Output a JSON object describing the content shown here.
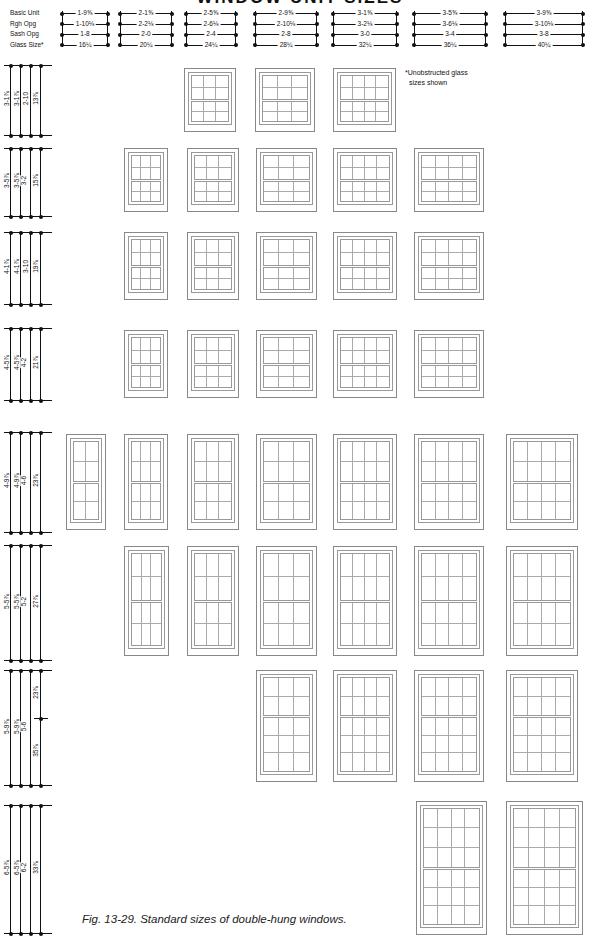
{
  "title": "WINDOW UNIT SIZES",
  "legend": [
    "Basic Unit",
    "Rgh Opg",
    "Sash Opg",
    "Glass Size*"
  ],
  "note": [
    "*Unobstructed glass",
    "sizes shown"
  ],
  "caption": "Fig. 13-29. Standard sizes of double-hung windows.",
  "columns": [
    {
      "x": 62,
      "w": 46,
      "values": [
        "1-9⅝",
        "1-10⅛",
        "1-8",
        "16¼"
      ]
    },
    {
      "x": 120,
      "w": 52,
      "values": [
        "2-1⅝",
        "2-2⅛",
        "2-0",
        "20¼"
      ]
    },
    {
      "x": 186,
      "w": 50,
      "values": [
        "2-5⅝",
        "2-6⅛",
        "2-4",
        "24¼"
      ]
    },
    {
      "x": 255,
      "w": 62,
      "values": [
        "2-9⅝",
        "2-10⅛",
        "2-8",
        "28¼"
      ]
    },
    {
      "x": 333,
      "w": 64,
      "values": [
        "3-1⅝",
        "3-2⅛",
        "3-0",
        "32¼"
      ]
    },
    {
      "x": 414,
      "w": 72,
      "values": [
        "3-5⅝",
        "3-6⅛",
        "3-4",
        "36¼"
      ]
    },
    {
      "x": 505,
      "w": 78,
      "values": [
        "3-9⅝",
        "3-10⅛",
        "3-8",
        "40¼"
      ]
    }
  ],
  "rows": [
    {
      "y": 65,
      "h": 70,
      "values": [
        "3-1⅞",
        "3-1⅞",
        "2-10",
        "13⅞"
      ]
    },
    {
      "y": 148,
      "h": 68,
      "values": [
        "3-5⅞",
        "3-5⅞",
        "3-2",
        "15⅞"
      ]
    },
    {
      "y": 232,
      "h": 72,
      "values": [
        "4-1⅞",
        "4-1⅞",
        "3-10",
        "19⅞"
      ]
    },
    {
      "y": 328,
      "h": 72,
      "values": [
        "4-5⅞",
        "4-5⅞",
        "4-2",
        "21⅞"
      ]
    },
    {
      "y": 432,
      "h": 100,
      "values": [
        "4-9⅞",
        "4-9⅞",
        "4-6",
        "23⅞"
      ]
    },
    {
      "y": 545,
      "h": 115,
      "values": [
        "5-5⅞",
        "5-5⅞",
        "5-2",
        "27⅞"
      ]
    },
    {
      "y": 670,
      "h": 115,
      "values": [
        "5-9⅞",
        "5-9⅞",
        "5-6",
        "23⅞",
        "35⅞"
      ]
    },
    {
      "y": 805,
      "h": 128,
      "values": [
        "6-5⅞",
        "6-5⅞",
        "6-2",
        "33⅞"
      ]
    }
  ],
  "windows": [
    {
      "row": 0,
      "col": 2,
      "x": 184,
      "y": 68,
      "w": 52,
      "h": 64,
      "cols": 3,
      "top": 2,
      "bot": 2
    },
    {
      "row": 0,
      "col": 3,
      "x": 255,
      "y": 68,
      "w": 60,
      "h": 64,
      "cols": 3,
      "top": 2,
      "bot": 2
    },
    {
      "row": 0,
      "col": 4,
      "x": 333,
      "y": 68,
      "w": 63,
      "h": 64,
      "cols": 4,
      "top": 2,
      "bot": 2
    },
    {
      "row": 1,
      "col": 1,
      "x": 124,
      "y": 148,
      "w": 44,
      "h": 64,
      "cols": 3,
      "top": 2,
      "bot": 2
    },
    {
      "row": 1,
      "col": 2,
      "x": 187,
      "y": 148,
      "w": 52,
      "h": 64,
      "cols": 3,
      "top": 2,
      "bot": 2
    },
    {
      "row": 1,
      "col": 3,
      "x": 256,
      "y": 148,
      "w": 61,
      "h": 64,
      "cols": 3,
      "top": 2,
      "bot": 2
    },
    {
      "row": 1,
      "col": 4,
      "x": 333,
      "y": 148,
      "w": 64,
      "h": 64,
      "cols": 4,
      "top": 2,
      "bot": 2
    },
    {
      "row": 1,
      "col": 5,
      "x": 414,
      "y": 148,
      "w": 70,
      "h": 64,
      "cols": 4,
      "top": 2,
      "bot": 2
    },
    {
      "row": 2,
      "col": 1,
      "x": 124,
      "y": 232,
      "w": 44,
      "h": 68,
      "cols": 3,
      "top": 2,
      "bot": 2
    },
    {
      "row": 2,
      "col": 2,
      "x": 187,
      "y": 232,
      "w": 52,
      "h": 68,
      "cols": 3,
      "top": 2,
      "bot": 2
    },
    {
      "row": 2,
      "col": 3,
      "x": 256,
      "y": 232,
      "w": 61,
      "h": 68,
      "cols": 3,
      "top": 2,
      "bot": 2
    },
    {
      "row": 2,
      "col": 4,
      "x": 333,
      "y": 232,
      "w": 64,
      "h": 68,
      "cols": 4,
      "top": 2,
      "bot": 2
    },
    {
      "row": 2,
      "col": 5,
      "x": 414,
      "y": 232,
      "w": 70,
      "h": 68,
      "cols": 4,
      "top": 2,
      "bot": 2
    },
    {
      "row": 3,
      "col": 1,
      "x": 124,
      "y": 330,
      "w": 44,
      "h": 68,
      "cols": 3,
      "top": 2,
      "bot": 2
    },
    {
      "row": 3,
      "col": 2,
      "x": 187,
      "y": 330,
      "w": 52,
      "h": 68,
      "cols": 3,
      "top": 2,
      "bot": 2
    },
    {
      "row": 3,
      "col": 3,
      "x": 256,
      "y": 330,
      "w": 61,
      "h": 68,
      "cols": 3,
      "top": 2,
      "bot": 2
    },
    {
      "row": 3,
      "col": 4,
      "x": 333,
      "y": 330,
      "w": 64,
      "h": 68,
      "cols": 4,
      "top": 2,
      "bot": 2
    },
    {
      "row": 3,
      "col": 5,
      "x": 414,
      "y": 330,
      "w": 70,
      "h": 68,
      "cols": 4,
      "top": 2,
      "bot": 2
    },
    {
      "row": 4,
      "col": 0,
      "x": 66,
      "y": 434,
      "w": 40,
      "h": 96,
      "cols": 2,
      "top": 2,
      "bot": 2
    },
    {
      "row": 4,
      "col": 1,
      "x": 124,
      "y": 434,
      "w": 44,
      "h": 96,
      "cols": 3,
      "top": 2,
      "bot": 2
    },
    {
      "row": 4,
      "col": 2,
      "x": 187,
      "y": 434,
      "w": 52,
      "h": 96,
      "cols": 3,
      "top": 2,
      "bot": 2
    },
    {
      "row": 4,
      "col": 3,
      "x": 256,
      "y": 434,
      "w": 61,
      "h": 96,
      "cols": 3,
      "top": 2,
      "bot": 2
    },
    {
      "row": 4,
      "col": 4,
      "x": 333,
      "y": 434,
      "w": 64,
      "h": 96,
      "cols": 4,
      "top": 2,
      "bot": 2
    },
    {
      "row": 4,
      "col": 5,
      "x": 414,
      "y": 434,
      "w": 70,
      "h": 96,
      "cols": 4,
      "top": 2,
      "bot": 2
    },
    {
      "row": 4,
      "col": 6,
      "x": 506,
      "y": 434,
      "w": 72,
      "h": 96,
      "cols": 4,
      "top": 2,
      "bot": 2
    },
    {
      "row": 5,
      "col": 1,
      "x": 124,
      "y": 546,
      "w": 45,
      "h": 110,
      "cols": 3,
      "top": 2,
      "bot": 2
    },
    {
      "row": 5,
      "col": 2,
      "x": 187,
      "y": 546,
      "w": 52,
      "h": 110,
      "cols": 3,
      "top": 2,
      "bot": 2
    },
    {
      "row": 5,
      "col": 3,
      "x": 256,
      "y": 546,
      "w": 61,
      "h": 110,
      "cols": 3,
      "top": 2,
      "bot": 2
    },
    {
      "row": 5,
      "col": 4,
      "x": 333,
      "y": 546,
      "w": 64,
      "h": 110,
      "cols": 4,
      "top": 2,
      "bot": 2
    },
    {
      "row": 5,
      "col": 5,
      "x": 414,
      "y": 546,
      "w": 70,
      "h": 110,
      "cols": 4,
      "top": 2,
      "bot": 2
    },
    {
      "row": 5,
      "col": 6,
      "x": 506,
      "y": 546,
      "w": 72,
      "h": 110,
      "cols": 4,
      "top": 2,
      "bot": 2
    },
    {
      "row": 6,
      "col": 3,
      "x": 256,
      "y": 670,
      "w": 61,
      "h": 112,
      "cols": 3,
      "top": 2,
      "bot": 3
    },
    {
      "row": 6,
      "col": 4,
      "x": 333,
      "y": 670,
      "w": 64,
      "h": 112,
      "cols": 4,
      "top": 2,
      "bot": 3
    },
    {
      "row": 6,
      "col": 5,
      "x": 414,
      "y": 670,
      "w": 70,
      "h": 112,
      "cols": 4,
      "top": 2,
      "bot": 3
    },
    {
      "row": 6,
      "col": 6,
      "x": 506,
      "y": 670,
      "w": 72,
      "h": 112,
      "cols": 4,
      "top": 2,
      "bot": 3
    },
    {
      "row": 7,
      "col": 5,
      "x": 416,
      "y": 801,
      "w": 71,
      "h": 134,
      "cols": 4,
      "top": 3,
      "bot": 3
    },
    {
      "row": 7,
      "col": 6,
      "x": 506,
      "y": 801,
      "w": 77,
      "h": 134,
      "cols": 4,
      "top": 3,
      "bot": 3
    }
  ]
}
